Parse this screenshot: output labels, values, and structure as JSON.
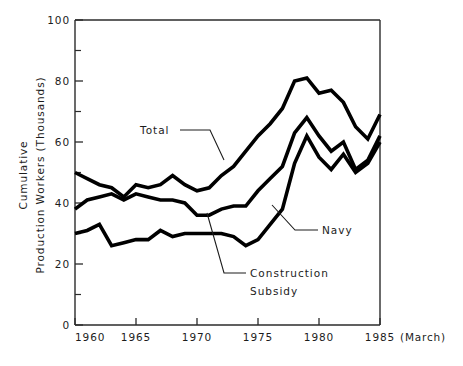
{
  "chart_data": {
    "type": "line",
    "title": "",
    "xlabel": "",
    "ylabel": "Cumulative Production Workers (Thousands)",
    "ylabel_lines": [
      "Cumulative",
      "Production Workers (Thousands)"
    ],
    "xlim": [
      1960,
      1985
    ],
    "ylim": [
      0,
      100
    ],
    "yticks": [
      0,
      20,
      40,
      60,
      80,
      100
    ],
    "ytick_labels": [
      "0",
      "20",
      "40",
      "60",
      "80",
      "100"
    ],
    "yticks_minor": [
      10,
      30,
      50,
      70,
      90
    ],
    "xticks": [
      1960,
      1965,
      1970,
      1975,
      1980,
      1985
    ],
    "xtick_labels": [
      "1960",
      "1965",
      "1970",
      "1975",
      "1980",
      "1985"
    ],
    "x_axis_note": "(March)",
    "grid": false,
    "legend": "annotations",
    "x": [
      1960,
      1961,
      1962,
      1963,
      1964,
      1965,
      1966,
      1967,
      1968,
      1969,
      1970,
      1971,
      1972,
      1973,
      1974,
      1975,
      1976,
      1977,
      1978,
      1979,
      1980,
      1981,
      1982,
      1983,
      1984,
      1985
    ],
    "series": [
      {
        "name": "Total",
        "values": [
          50,
          48,
          46,
          45,
          42,
          46,
          45,
          46,
          49,
          46,
          44,
          45,
          49,
          52,
          57,
          62,
          66,
          71,
          80,
          81,
          76,
          77,
          73,
          65,
          61,
          69
        ]
      },
      {
        "name": "Navy",
        "values": [
          38,
          41,
          42,
          43,
          41,
          43,
          42,
          41,
          41,
          40,
          36,
          36,
          38,
          39,
          39,
          44,
          48,
          52,
          63,
          68,
          62,
          57,
          60,
          51,
          54,
          62
        ]
      },
      {
        "name": "Construction Subsidy",
        "values": [
          30,
          31,
          33,
          26,
          27,
          28,
          28,
          31,
          29,
          30,
          30,
          30,
          30,
          29,
          26,
          28,
          33,
          38,
          53,
          62,
          55,
          51,
          56,
          50,
          53,
          60
        ]
      }
    ],
    "annotations": [
      {
        "label": "Total",
        "series": "Total"
      },
      {
        "label": "Navy",
        "series": "Navy"
      },
      {
        "label": "Construction",
        "label2": "Subsidy",
        "series": "Construction Subsidy"
      }
    ]
  }
}
